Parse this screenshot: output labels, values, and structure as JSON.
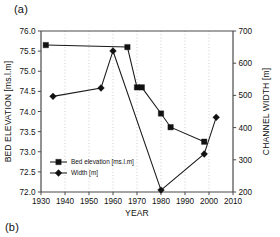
{
  "figure": {
    "panel_label_a": "(a)",
    "panel_label_b": "(b)"
  },
  "chart_data": {
    "type": "line",
    "title": "",
    "xlabel": "YEAR",
    "ylabel": "BED ELEVATION [ms.l.m]",
    "y2label": "CHANNEL WIDTH [m]",
    "xlim": [
      1930,
      2010
    ],
    "ylim": [
      72.0,
      76.0
    ],
    "y2lim": [
      200,
      700
    ],
    "xticks": [
      1930,
      1940,
      1950,
      1960,
      1970,
      1980,
      1990,
      2000,
      2010
    ],
    "xticklabels": [
      "1930",
      "1940",
      "1950",
      "1960",
      "1970",
      "1980",
      "1990",
      "2000",
      "2010"
    ],
    "yticks": [
      72.0,
      72.5,
      73.0,
      73.5,
      74.0,
      74.5,
      75.0,
      75.5,
      76.0
    ],
    "yticklabels": [
      "72.0",
      "72.5",
      "73.0",
      "73.5",
      "74.0",
      "74.5",
      "75.0",
      "75.5",
      "76.0"
    ],
    "y2ticks": [
      200,
      300,
      400,
      500,
      600,
      700
    ],
    "y2ticklabels": [
      "200",
      "300",
      "400",
      "500",
      "600",
      "700"
    ],
    "grid": "vertical-dotted",
    "legend_position": "lower-left",
    "series": [
      {
        "name": "Bed elevation [ms.l.m]",
        "axis": "left",
        "marker": "square",
        "x": [
          1932,
          1966,
          1970,
          1972,
          1980,
          1984,
          1998
        ],
        "values": [
          75.65,
          75.6,
          74.6,
          74.6,
          73.95,
          73.61,
          73.25
        ]
      },
      {
        "name": "Width [m]",
        "axis": "right",
        "marker": "diamond",
        "x": [
          1935,
          1955,
          1960,
          1980,
          1998,
          2003
        ],
        "values": [
          497,
          523,
          638,
          206,
          318,
          432
        ]
      }
    ],
    "legend_entries": [
      "Bed elevation [ms.l.m]",
      "Width [m]"
    ],
    "colors": {
      "series": "#111111",
      "axis": "#4a4a4a",
      "grid": "#b9b9b9",
      "background": "#ffffff"
    }
  }
}
